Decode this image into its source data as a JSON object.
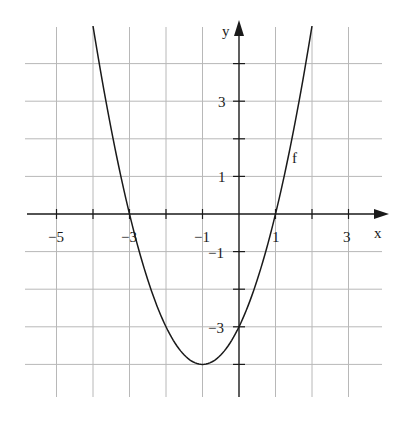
{
  "chart_data": {
    "type": "line",
    "title": "",
    "xlabel": "x",
    "ylabel": "y",
    "xlim": [
      -5.5,
      4.2
    ],
    "ylim": [
      -4.9,
      5.2
    ],
    "grid": true,
    "x_ticks": [
      -5,
      -4,
      -3,
      -2,
      -1,
      0,
      1,
      2,
      3
    ],
    "x_tick_labels": [
      {
        "value": -5,
        "label": "−5"
      },
      {
        "value": -3,
        "label": "−3"
      },
      {
        "value": -1,
        "label": "−1"
      },
      {
        "value": 1,
        "label": "1"
      },
      {
        "value": 3,
        "label": "3"
      }
    ],
    "y_ticks": [
      -4,
      -3,
      -2,
      -1,
      0,
      1,
      2,
      3,
      4
    ],
    "y_tick_labels": [
      {
        "value": 3,
        "label": "3"
      },
      {
        "value": 1,
        "label": "1"
      },
      {
        "value": -1,
        "label": "−1"
      },
      {
        "value": -3,
        "label": "−3"
      }
    ],
    "series": [
      {
        "name": "f",
        "expression": "f(x) = x^2 + 2x - 3",
        "x": [
          -4,
          -3.5,
          -3,
          -2.5,
          -2,
          -1.5,
          -1,
          -0.5,
          0,
          0.5,
          1,
          1.5,
          2
        ],
        "values": [
          5,
          2.25,
          0,
          -1.75,
          -3,
          -3.75,
          -4,
          -3.75,
          -3,
          -1.75,
          0,
          2.25,
          5
        ]
      }
    ],
    "annotations": [
      {
        "text": "f",
        "x": 1.6,
        "y": 1.5
      }
    ],
    "key_points": {
      "roots": [
        -3,
        1
      ],
      "vertex": [
        -1,
        -4
      ],
      "y_intercept": -3
    }
  },
  "labels": {
    "x_axis": "x",
    "y_axis": "y",
    "curve": "f",
    "x_m5": "−5",
    "x_m3": "−3",
    "x_m1": "−1",
    "x_1": "1",
    "x_3": "3",
    "y_3": "3",
    "y_1": "1",
    "y_m1": "−1",
    "y_m3": "−3"
  }
}
